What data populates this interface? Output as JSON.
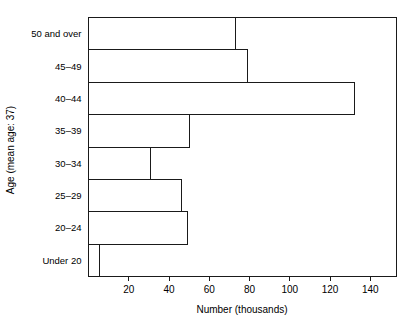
{
  "chart_data": {
    "type": "bar",
    "orientation": "horizontal",
    "title": "",
    "xlabel": "Number (thousands)",
    "ylabel": "Age (mean age: 37)",
    "categories": [
      "Under 20",
      "20–24",
      "25–29",
      "30–34",
      "35–39",
      "40–44",
      "45–49",
      "50 and over"
    ],
    "values": [
      5.5,
      49,
      46,
      31,
      50,
      132,
      79,
      73
    ],
    "xlim": [
      0,
      153
    ],
    "xticks": [
      20,
      40,
      60,
      80,
      100,
      120,
      140
    ],
    "xtick_labels": [
      "20",
      "40",
      "60",
      "80",
      "100",
      "120",
      "140"
    ],
    "grid": false,
    "legend": null,
    "bar_fill_color": "#ffffff",
    "bar_edge_color": "#1a1a1a"
  },
  "axes": {
    "y_axis_title": "Age (mean age: 37)",
    "x_axis_title": "Number (thousands)"
  }
}
